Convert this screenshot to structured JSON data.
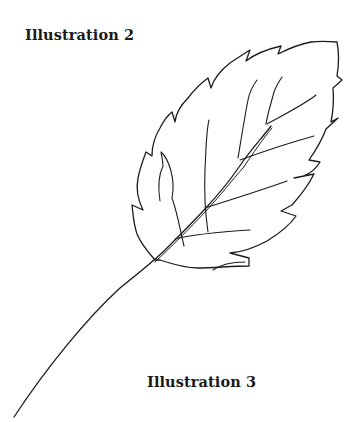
{
  "captions": {
    "top": "Illustration 2",
    "bottom": "Illustration 3"
  },
  "figure": {
    "stroke_color": "#1c1c1c",
    "background": "#ffffff"
  }
}
